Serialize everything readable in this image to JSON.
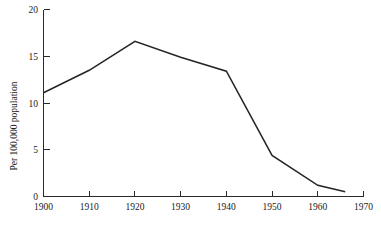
{
  "chart_data": {
    "type": "line",
    "title": "",
    "subtitle": "",
    "xlabel": "",
    "ylabel": "Per 100,000 population",
    "xlim": [
      1900,
      1970
    ],
    "ylim": [
      0,
      20
    ],
    "xticks": [
      1900,
      1910,
      1920,
      1930,
      1940,
      1950,
      1960,
      1970
    ],
    "xtick_labels": [
      "1900",
      "1910",
      "1920",
      "1930",
      "1940",
      "1950",
      "1960",
      "1970"
    ],
    "yticks": [
      0,
      5,
      10,
      15,
      20
    ],
    "ytick_labels": [
      "0",
      "5",
      "10",
      "15",
      "20"
    ],
    "grid": false,
    "legend": false,
    "legend_position": "none",
    "line_color": "#252525",
    "axis_color": "#2b2b2b",
    "background_color": "#ffffff",
    "series": [
      {
        "name": "Rate per 100,000 population",
        "x": [
          1900,
          1910,
          1920,
          1930,
          1940,
          1950,
          1960,
          1966
        ],
        "values": [
          11.1,
          13.5,
          16.6,
          14.9,
          13.4,
          4.4,
          1.2,
          0.5
        ]
      }
    ]
  },
  "axis_titles": {
    "y": "Per 100,000 population"
  }
}
